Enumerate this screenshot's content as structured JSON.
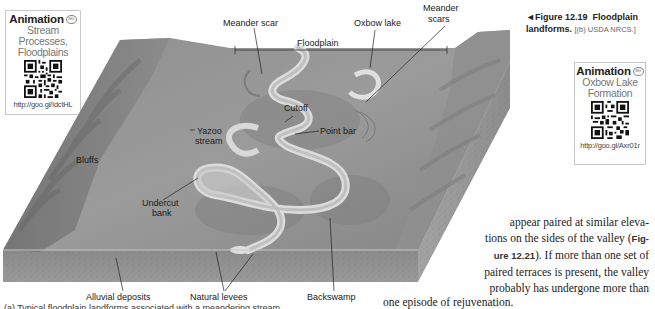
{
  "animation_boxes": [
    {
      "title": "Animation",
      "badge": "MG",
      "subtitle_line1": "Stream Processes,",
      "subtitle_line2": "Floodplains",
      "url": "http://goo.gl/IdctHL",
      "qr_icon": "qr-code-icon"
    },
    {
      "title": "Animation",
      "badge": "MG",
      "subtitle_line1": "Oxbow Lake",
      "subtitle_line2": "Formation",
      "url": "http://goo.gl/Axr01r",
      "qr_icon": "qr-code-icon"
    }
  ],
  "figure": {
    "marker": "◄",
    "number": "Figure 12.19",
    "title": "Floodplain",
    "title_line2": "landforms.",
    "credit": "[(b) USDA NRCS.]"
  },
  "diagram_labels": {
    "meander_scar": "Meander scar",
    "oxbow_lake": "Oxbow lake",
    "meander_scars_line1": "Meander",
    "meander_scars_line2": "scars",
    "floodplain": "Floodplain",
    "cutoff": "Cutoff",
    "yazoo_line1": "Yazoo",
    "yazoo_line2": "stream",
    "point_bar": "Point bar",
    "bluffs": "Bluffs",
    "undercut_line1": "Undercut",
    "undercut_line2": "bank",
    "alluvial_deposits": "Alluvial deposits",
    "natural_levees": "Natural levees",
    "backswamp": "Backswamp"
  },
  "body_text": {
    "line1": "appear paired at similar eleva-",
    "line2_pre": "tions on the sides of the valley (",
    "line2_ref": "Fig-",
    "line3_ref": "ure 12.21",
    "line3_post": "). If more than one set of",
    "line4": "paired terraces is present, the valley",
    "line5": "probably has undergone more than",
    "line6": "one episode of rejuvenation."
  },
  "bottom_caption": "(a) Typical floodplain landforms associated with a meandering stream."
}
